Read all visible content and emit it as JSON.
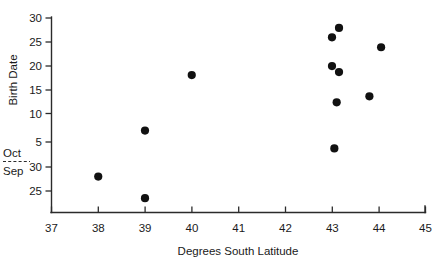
{
  "chart_data": {
    "type": "scatter",
    "title": "",
    "xlabel": "Degrees South Latitude",
    "ylabel": "Birth Date",
    "xlim": [
      37,
      45
    ],
    "ylim_upper_month": "Oct",
    "ylim_lower_month": "Sep",
    "grid": false,
    "legend": false,
    "axis_break_label_top": "Oct",
    "axis_break_label_bottom": "Sep",
    "xticks": [
      37,
      38,
      39,
      40,
      41,
      42,
      43,
      44,
      45
    ],
    "xticklabels": [
      "37",
      "38",
      "39",
      "40",
      "41",
      "42",
      "43",
      "44",
      "45"
    ],
    "yticks_october": [
      30,
      25,
      20,
      15,
      10,
      5
    ],
    "yticklabels_october": [
      "30",
      "25",
      "20",
      "15",
      "10",
      "5"
    ],
    "yticks_september": [
      30,
      25
    ],
    "yticklabels_september": [
      "30",
      "25"
    ],
    "points": [
      {
        "x": 38.0,
        "day": 28,
        "month": "Sep"
      },
      {
        "x": 39.0,
        "day": 23.5,
        "month": "Sep"
      },
      {
        "x": 39.0,
        "day": 7.3,
        "month": "Oct"
      },
      {
        "x": 40.0,
        "day": 18.5,
        "month": "Oct"
      },
      {
        "x": 43.05,
        "day": 3.7,
        "month": "Oct"
      },
      {
        "x": 43.1,
        "day": 13.0,
        "month": "Oct"
      },
      {
        "x": 43.8,
        "day": 14.2,
        "month": "Oct"
      },
      {
        "x": 43.0,
        "day": 20.3,
        "month": "Oct"
      },
      {
        "x": 43.15,
        "day": 19.1,
        "month": "Oct"
      },
      {
        "x": 43.0,
        "day": 26.1,
        "month": "Oct"
      },
      {
        "x": 43.15,
        "day": 28.0,
        "month": "Oct"
      },
      {
        "x": 44.05,
        "day": 24.1,
        "month": "Oct"
      }
    ]
  },
  "colors": {
    "background": "#ffffff",
    "axis": "#2b2b2b",
    "marker": "#111111",
    "text": "#1a1a1a"
  }
}
